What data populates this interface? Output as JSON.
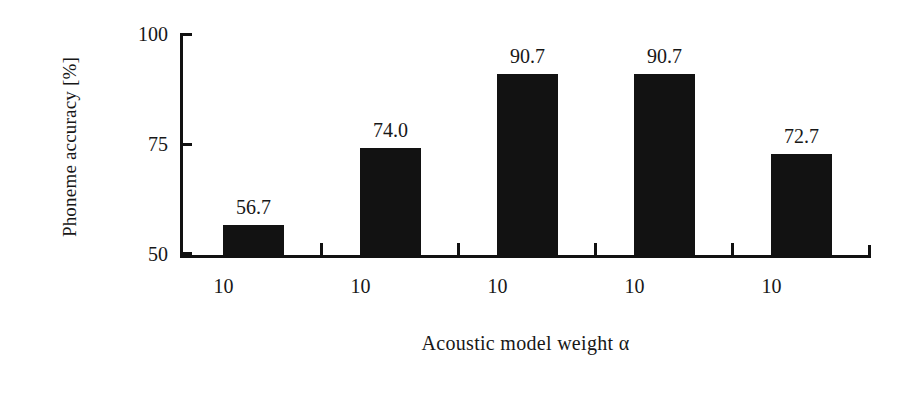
{
  "chart_data": {
    "type": "bar",
    "title": "",
    "subtitle": "",
    "xlabel": "Acoustic model weight α",
    "ylabel": "Phoneme accuracy [%]",
    "categories": [
      "10",
      "10",
      "10",
      "10",
      "10"
    ],
    "values": [
      56.7,
      74.0,
      90.7,
      90.7,
      72.7
    ],
    "value_labels": [
      "56.7",
      "74.0",
      "90.7",
      "90.7",
      "72.7"
    ],
    "ylim": [
      50,
      100
    ],
    "yticks": [
      50,
      75,
      100
    ],
    "ytick_labels": [
      "50",
      "75",
      "100"
    ],
    "grid": false,
    "legend": null,
    "bar_color": "#121212",
    "axis_color": "#111111",
    "background": "#ffffff"
  },
  "figure": {
    "y_axis_title": "Phoneme accuracy [%]",
    "x_axis_title": "Acoustic model weight α"
  }
}
